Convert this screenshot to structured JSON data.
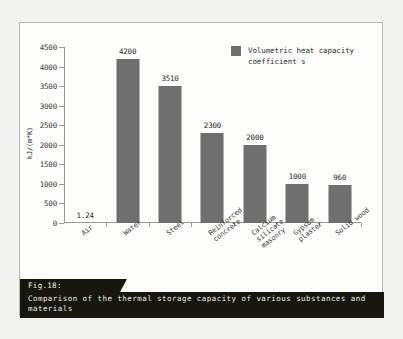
{
  "figure": {
    "caption_tag": "Fig.18:",
    "caption_text": "Comparison of the thermal storage capacity of various substances and\nmaterials"
  },
  "legend": {
    "label": "Volumetric heat capacity\ncoefficient s",
    "swatch_name": "legend-swatch-gray"
  },
  "colors": {
    "bar": "#6f6f6f",
    "axis": "#9a9a96",
    "caption_bg": "#17160f",
    "caption_fg": "#eeede6",
    "page_bg": "#f2f2f0",
    "frame_bg": "#fdfdfb"
  },
  "chart_data": {
    "type": "bar",
    "title": "",
    "xlabel": "",
    "ylabel": "kJ/(m*K)",
    "ylim": [
      0,
      4500
    ],
    "yticks": [
      0,
      500,
      1000,
      1500,
      2000,
      2500,
      3000,
      3500,
      4000,
      4500
    ],
    "ytick_labels": [
      "0",
      "500",
      "1000",
      "1500",
      "2000",
      "2500",
      "3000",
      "3500",
      "4000",
      "4500"
    ],
    "grid": false,
    "legend_position": "top-right",
    "categories": [
      "Air",
      "Water",
      "Steel",
      "Reinforced\nconcrete",
      "Calcium\nsilicate\nmasonry",
      "Gypsum\nplaster",
      "Solid wood"
    ],
    "series": [
      {
        "name": "Volumetric heat capacity coefficient s",
        "values": [
          1.24,
          4200,
          3510,
          2300,
          2000,
          1000,
          960
        ],
        "value_labels": [
          "1.24",
          "4200",
          "3510",
          "2300",
          "2000",
          "1000",
          "960"
        ]
      }
    ]
  }
}
